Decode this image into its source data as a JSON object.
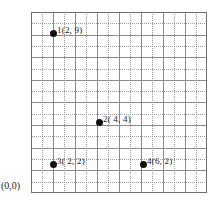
{
  "figure": {
    "origin_label": "(0,0)",
    "caption": "",
    "colors": {
      "point": "#111111",
      "major_grid": "#8c8c8c",
      "minor_grid": "#9a9a9a",
      "border": "#6f6f6f",
      "background": "#ffffff",
      "text": "#1c1c1c"
    }
  },
  "chart_data": {
    "type": "scatter",
    "title": "",
    "xlabel": "",
    "ylabel": "",
    "xlim": [
      0,
      8
    ],
    "ylim": [
      0,
      8
    ],
    "grid": true,
    "major_step": 1,
    "minor_step": 0.5,
    "legend": "none",
    "origin_annotation": "(0,0)",
    "points": [
      {
        "id": "1",
        "label": "1(2, 9)",
        "x": 2,
        "y": 7.1,
        "px": 53,
        "py": 33
      },
      {
        "id": "2",
        "label": "2( 4, 4)",
        "x": 4,
        "y": 3.2,
        "px": 99,
        "py": 122
      },
      {
        "id": "3",
        "label": "3( 2, 2)",
        "x": 2,
        "y": 1.3,
        "px": 53,
        "py": 164
      },
      {
        "id": "4",
        "label": "4(6, 2)",
        "x": 6,
        "y": 1.3,
        "px": 143,
        "py": 164
      }
    ]
  }
}
